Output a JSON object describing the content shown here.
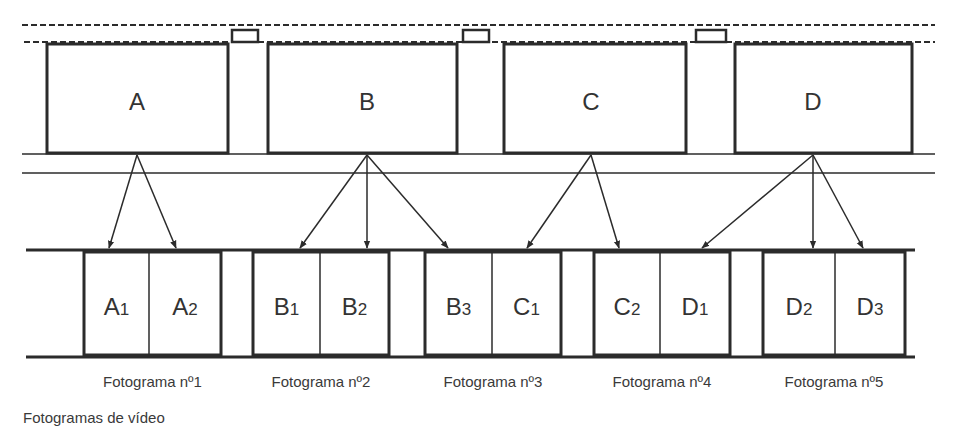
{
  "colors": {
    "stroke": "#2b2b2b",
    "text": "#333333",
    "background": "#ffffff"
  },
  "film_strip": {
    "dashed_lines": [
      {
        "y": 25,
        "x1": 22,
        "x2": 935
      },
      {
        "y": 42,
        "x1": 24,
        "x2": 935
      }
    ],
    "rails": [
      {
        "y": 154,
        "x1": 22,
        "x2": 935
      },
      {
        "y": 173,
        "x1": 22,
        "x2": 935
      }
    ],
    "sprockets": [
      {
        "x": 232,
        "w": 26
      },
      {
        "x": 463,
        "w": 26
      },
      {
        "x": 696,
        "w": 30
      }
    ],
    "frames": [
      {
        "label": "A",
        "x1": 47,
        "x2": 228,
        "cx": 137
      },
      {
        "label": "B",
        "x1": 268,
        "x2": 457,
        "cx": 367
      },
      {
        "label": "C",
        "x1": 504,
        "x2": 686,
        "cx": 591
      },
      {
        "label": "D",
        "x1": 735,
        "x2": 912,
        "cx": 813
      }
    ]
  },
  "video": {
    "rail_top_y": 250,
    "rail_bottom_y": 357,
    "rail_x1": 26,
    "rail_x2": 915,
    "frames": [
      {
        "caption": "Fotograma nº1",
        "x1": 84,
        "x2": 221,
        "divider": 149,
        "fields": [
          {
            "letter": "A",
            "sub": "1"
          },
          {
            "letter": "A",
            "sub": "2"
          }
        ]
      },
      {
        "caption": "Fotograma nº2",
        "x1": 253,
        "x2": 389,
        "divider": 320,
        "fields": [
          {
            "letter": "B",
            "sub": "1"
          },
          {
            "letter": "B",
            "sub": "2"
          }
        ]
      },
      {
        "caption": "Fotograma nº3",
        "x1": 425,
        "x2": 561,
        "divider": 492,
        "fields": [
          {
            "letter": "B",
            "sub": "3"
          },
          {
            "letter": "C",
            "sub": "1"
          }
        ]
      },
      {
        "caption": "Fotograma nº4",
        "x1": 594,
        "x2": 730,
        "divider": 660,
        "fields": [
          {
            "letter": "C",
            "sub": "2"
          },
          {
            "letter": "D",
            "sub": "1"
          }
        ]
      },
      {
        "caption": "Fotograma nº5",
        "x1": 763,
        "x2": 905,
        "divider": 835,
        "fields": [
          {
            "letter": "D",
            "sub": "2"
          },
          {
            "letter": "D",
            "sub": "3"
          }
        ]
      }
    ]
  },
  "arrows": [
    {
      "from": "A",
      "x1": 137,
      "x2": 109
    },
    {
      "from": "A",
      "x1": 137,
      "x2": 176
    },
    {
      "from": "B",
      "x1": 367,
      "x2": 300
    },
    {
      "from": "B",
      "x1": 367,
      "x2": 367
    },
    {
      "from": "B",
      "x1": 367,
      "x2": 448
    },
    {
      "from": "C",
      "x1": 591,
      "x2": 527
    },
    {
      "from": "C",
      "x1": 591,
      "x2": 619
    },
    {
      "from": "D",
      "x1": 813,
      "x2": 702
    },
    {
      "from": "D",
      "x1": 813,
      "x2": 813
    },
    {
      "from": "D",
      "x1": 813,
      "x2": 863
    }
  ],
  "caption": "Fotogramas de vídeo"
}
